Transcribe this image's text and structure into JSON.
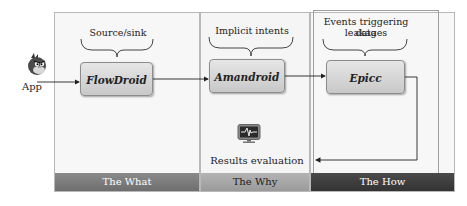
{
  "input": {
    "label": "App",
    "icon": "angry-bird-icon"
  },
  "stages": [
    {
      "id": "what",
      "band_label": "The What",
      "tool": "FlowDroid",
      "annotation": "Source/sink"
    },
    {
      "id": "why",
      "band_label": "The Why",
      "tool": "Amandroid",
      "annotation": "Implicit intents"
    },
    {
      "id": "how",
      "band_label": "The How",
      "tool": "Epicc",
      "annotation_line1": "Events triggering data",
      "annotation_line2": "leakages"
    }
  ],
  "output": {
    "label": "Results evaluation",
    "icon": "monitor-waveform-icon"
  },
  "colors": {
    "band_what": "#7a7a7a",
    "band_why": "#a8a8a8",
    "band_how": "#3c3c3c",
    "box_fill": "#d6d6d6"
  }
}
